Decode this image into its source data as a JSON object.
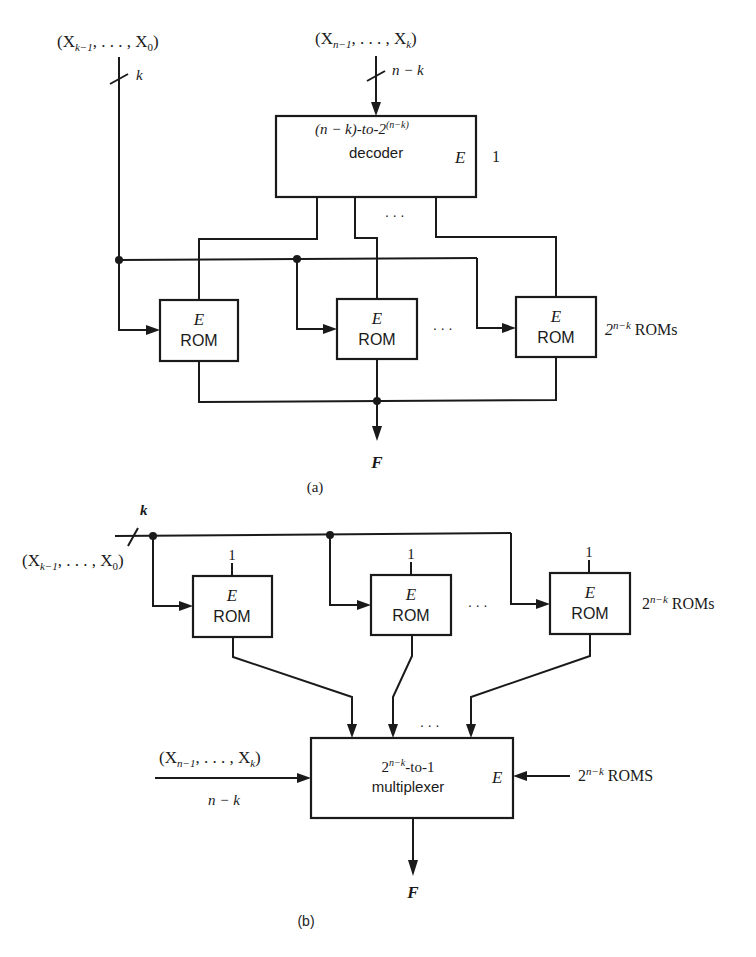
{
  "figure_a": {
    "caption": "(a)",
    "input_low": {
      "label_open": "(X",
      "label_sub1": "k−1",
      "label_mid": ", . . . , X",
      "label_sub2": "0",
      "label_close": ")",
      "width_label": "k"
    },
    "input_high": {
      "label_open": "(X",
      "label_sub1": "n−1",
      "label_mid": ", . . . , X",
      "label_sub2": "k",
      "label_close": ")",
      "width_label": "n − k"
    },
    "decoder": {
      "line1_prefix": "(n − k)-to-2",
      "line1_sup": "(n−k)",
      "line2": "decoder",
      "enable_label": "E",
      "enable_value": "1"
    },
    "ellipsis_decoder": ". . .",
    "roms": [
      {
        "enable": "E",
        "label": "ROM"
      },
      {
        "enable": "E",
        "label": "ROM"
      },
      {
        "enable": "E",
        "label": "ROM"
      }
    ],
    "ellipsis_roms": ". . .",
    "rom_count_base": "2",
    "rom_count_sup": "n−k",
    "rom_count_suffix": " ROMs",
    "output_label": "F"
  },
  "figure_b": {
    "caption": "(b)",
    "input_low": {
      "label_open": "(X",
      "label_sub1": "k−1",
      "label_mid": ", . . . , X",
      "label_sub2": "0",
      "label_close": ")",
      "width_label": "k"
    },
    "roms": [
      {
        "enable": "E",
        "label": "ROM",
        "enable_value": "1"
      },
      {
        "enable": "E",
        "label": "ROM",
        "enable_value": "1"
      },
      {
        "enable": "E",
        "label": "ROM",
        "enable_value": "1"
      }
    ],
    "ellipsis_roms": ". . .",
    "rom_count_base": "2",
    "rom_count_sup": "n−k",
    "rom_count_suffix": " ROMs",
    "mux": {
      "line1_base": "2",
      "line1_sup": "n−k",
      "line1_suffix": "-to-1",
      "line2": "multiplexer",
      "enable_label": "E"
    },
    "ellipsis_mux": ". . .",
    "select_input": {
      "label_open": "(X",
      "label_sub1": "n−1",
      "label_mid": ", . . . , X",
      "label_sub2": "k",
      "label_close": ")",
      "width_label": "n − k"
    },
    "enable_input": {
      "base": "2",
      "sup": "n−k",
      "suffix": " ROMS"
    },
    "output_label": "F"
  }
}
